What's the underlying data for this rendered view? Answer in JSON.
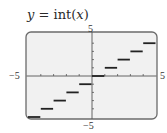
{
  "title": {
    "lhs": "y",
    "eq": " = int(",
    "var": "x",
    "close": ")"
  },
  "axis_labels": {
    "x_min": "−5",
    "x_max": "5",
    "y_max": "5",
    "y_min": "−5"
  },
  "colors": {
    "frame": "#6b6b6b",
    "plot_bg": "#f1f1f1",
    "step": "#222222",
    "axis": "#555555"
  },
  "chart_data": {
    "type": "line",
    "title": "y = int(x)",
    "xlabel": "",
    "ylabel": "",
    "xlim": [
      -5,
      5
    ],
    "ylim": [
      -5,
      5
    ],
    "grid": false,
    "x_tick_step": 1,
    "y_tick_step": 1,
    "tick_labels": {
      "x": [
        "-5",
        "5"
      ],
      "y": [
        "-5",
        "5"
      ]
    },
    "series": [
      {
        "name": "int(x)",
        "style": "step",
        "segments": [
          {
            "x_start": -5,
            "x_end": -4,
            "y": -5
          },
          {
            "x_start": -4,
            "x_end": -3,
            "y": -4
          },
          {
            "x_start": -3,
            "x_end": -2,
            "y": -3
          },
          {
            "x_start": -2,
            "x_end": -1,
            "y": -2
          },
          {
            "x_start": -1,
            "x_end": 0,
            "y": -1
          },
          {
            "x_start": 0,
            "x_end": 1,
            "y": 0
          },
          {
            "x_start": 1,
            "x_end": 2,
            "y": 1
          },
          {
            "x_start": 2,
            "x_end": 3,
            "y": 2
          },
          {
            "x_start": 3,
            "x_end": 4,
            "y": 3
          },
          {
            "x_start": 4,
            "x_end": 5,
            "y": 4
          }
        ]
      }
    ]
  }
}
